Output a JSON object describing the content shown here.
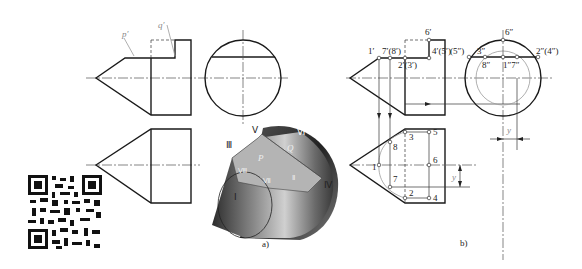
{
  "figure": {
    "subfigure_a": {
      "caption": "a)",
      "front_view_labels": {
        "p": "p′",
        "q": "q′"
      },
      "pictorial_labels": {
        "I": "Ⅰ",
        "II": "Ⅱ",
        "III": "Ⅲ",
        "IV": "Ⅳ",
        "V": "Ⅴ",
        "VI": "Ⅵ",
        "VII": "Ⅶ",
        "VIII": "Ⅷ",
        "P": "P",
        "Q": "Q"
      }
    },
    "subfigure_b": {
      "caption": "b)",
      "front_view_labels": {
        "p1": "1′",
        "p7_8": "7′(8′)",
        "p6": "6′",
        "p2_3": "2′(3′)",
        "p4_5": "4′(5′)"
      },
      "side_view_labels": {
        "p5": "(5″)",
        "p3": "3″",
        "p6": "6″",
        "p8": "8″",
        "p1_7": "1″7″",
        "p2_4": "2″(4″)",
        "dim_y": "y"
      },
      "top_view_labels": {
        "n1": "1",
        "n2": "2",
        "n3": "3",
        "n4": "4",
        "n5": "5",
        "n6": "6",
        "n7": "7",
        "n8": "8",
        "dim_y": "y"
      }
    },
    "qr_code": {
      "label": "qr-code"
    }
  }
}
